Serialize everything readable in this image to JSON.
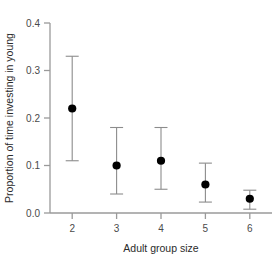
{
  "chart_data": {
    "type": "scatter",
    "title": "",
    "xlabel": "Adult group size",
    "ylabel": "Proportion of time investing in young",
    "x": [
      2,
      3,
      4,
      5,
      6
    ],
    "values": [
      0.22,
      0.1,
      0.11,
      0.06,
      0.03
    ],
    "error_low": [
      0.11,
      0.04,
      0.05,
      0.023,
      0.008
    ],
    "error_high": [
      0.33,
      0.18,
      0.18,
      0.105,
      0.048
    ],
    "xlim": [
      1.5,
      6.5
    ],
    "ylim": [
      0.0,
      0.41
    ],
    "xticks": [
      2,
      3,
      4,
      5,
      6
    ],
    "xtick_labels": [
      "2",
      "3",
      "4",
      "5",
      "6"
    ],
    "yticks": [
      0.0,
      0.1,
      0.2,
      0.3,
      0.4
    ],
    "ytick_labels": [
      "0.0",
      "0.1",
      "0.2",
      "0.3",
      "0.4"
    ],
    "grid": false,
    "legend": "none",
    "marker": "filled-circle",
    "errorbar_style": "capped-vertical",
    "colors": {
      "marker": "#000000",
      "errorbar": "#8c8c8c",
      "axis": "#9a9a9a",
      "tick_text": "#4a4a4a",
      "title_text": "#2b2b2b",
      "background": "#ffffff"
    }
  }
}
